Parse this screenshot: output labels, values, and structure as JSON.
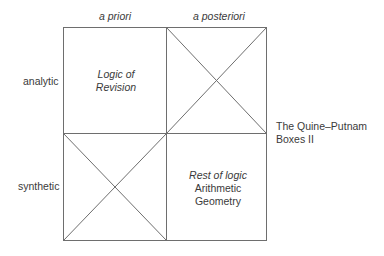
{
  "columns": {
    "left": "a priori",
    "right": "a posteriori"
  },
  "rows": {
    "top": "analytic",
    "bottom": "synthetic"
  },
  "cells": {
    "top_left": {
      "line1": "Logic of",
      "line2": "Revision",
      "crossed": false
    },
    "top_right": {
      "crossed": true
    },
    "bottom_left": {
      "crossed": true
    },
    "bottom_right": {
      "line1": "Rest of logic",
      "line2": "Arithmetic",
      "line3": "Geometry",
      "crossed": false
    }
  },
  "caption": {
    "line1": "The Quine–Putnam",
    "line2": "Boxes II"
  },
  "colors": {
    "line": "#6e6e6e",
    "text": "#3a3a3a"
  }
}
